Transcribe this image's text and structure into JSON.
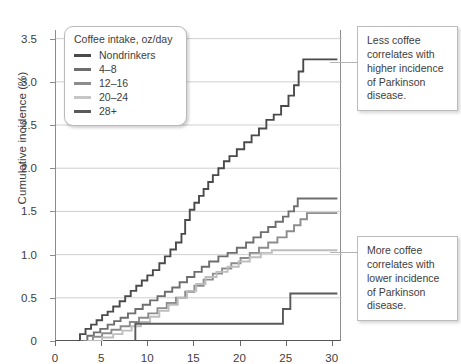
{
  "chart_data": {
    "type": "line",
    "title": "",
    "xlabel": "",
    "ylabel": "Cumulative incidence (%)",
    "xlim": [
      0,
      31
    ],
    "ylim": [
      0,
      3.6
    ],
    "xticks": [
      0,
      5,
      10,
      15,
      20,
      25,
      30
    ],
    "yticks": [
      "0",
      "0.5",
      "1.0",
      "1.5",
      "2.0",
      "2.5",
      "3.0",
      "3.5"
    ],
    "ytick_values": [
      0,
      0.5,
      1.0,
      1.5,
      2.0,
      2.5,
      3.0,
      3.5
    ],
    "grid": "horizontal",
    "step_style": "post",
    "legend_position": "top-left",
    "legend_title": "Coffee intake, oz/day",
    "series": [
      {
        "name": "Nondrinkers",
        "color": "#4a4a4a",
        "points": [
          [
            2.3,
            0.0
          ],
          [
            2.6,
            0.08
          ],
          [
            3.2,
            0.14
          ],
          [
            3.8,
            0.19
          ],
          [
            4.4,
            0.24
          ],
          [
            5.0,
            0.3
          ],
          [
            5.6,
            0.34
          ],
          [
            6.2,
            0.4
          ],
          [
            6.9,
            0.46
          ],
          [
            7.5,
            0.52
          ],
          [
            8.1,
            0.58
          ],
          [
            8.7,
            0.64
          ],
          [
            9.3,
            0.7
          ],
          [
            9.9,
            0.76
          ],
          [
            10.5,
            0.82
          ],
          [
            11.2,
            0.9
          ],
          [
            11.8,
            0.98
          ],
          [
            12.4,
            1.06
          ],
          [
            13.0,
            1.14
          ],
          [
            13.6,
            1.24
          ],
          [
            14.0,
            1.4
          ],
          [
            14.5,
            1.52
          ],
          [
            15.0,
            1.6
          ],
          [
            15.5,
            1.68
          ],
          [
            16.0,
            1.76
          ],
          [
            16.5,
            1.84
          ],
          [
            17.0,
            1.92
          ],
          [
            17.6,
            2.0
          ],
          [
            18.2,
            2.08
          ],
          [
            18.8,
            2.14
          ],
          [
            19.6,
            2.22
          ],
          [
            20.4,
            2.3
          ],
          [
            21.2,
            2.38
          ],
          [
            22.0,
            2.46
          ],
          [
            22.8,
            2.56
          ],
          [
            23.6,
            2.62
          ],
          [
            24.4,
            2.72
          ],
          [
            25.2,
            2.84
          ],
          [
            25.8,
            2.96
          ],
          [
            26.3,
            3.12
          ],
          [
            26.8,
            3.26
          ],
          [
            30.5,
            3.26
          ]
        ]
      },
      {
        "name": "4–8",
        "color": "#6e6e6e",
        "points": [
          [
            2.6,
            0.0
          ],
          [
            3.4,
            0.06
          ],
          [
            4.1,
            0.1
          ],
          [
            4.8,
            0.14
          ],
          [
            5.6,
            0.19
          ],
          [
            6.3,
            0.23
          ],
          [
            7.0,
            0.27
          ],
          [
            7.8,
            0.32
          ],
          [
            8.6,
            0.37
          ],
          [
            9.4,
            0.42
          ],
          [
            10.2,
            0.47
          ],
          [
            11.0,
            0.52
          ],
          [
            11.8,
            0.57
          ],
          [
            12.6,
            0.62
          ],
          [
            13.4,
            0.68
          ],
          [
            14.2,
            0.74
          ],
          [
            15.0,
            0.8
          ],
          [
            15.8,
            0.86
          ],
          [
            16.6,
            0.92
          ],
          [
            17.6,
            0.98
          ],
          [
            18.6,
            1.02
          ],
          [
            19.6,
            1.08
          ],
          [
            20.6,
            1.14
          ],
          [
            21.4,
            1.2
          ],
          [
            22.2,
            1.26
          ],
          [
            23.0,
            1.32
          ],
          [
            23.8,
            1.38
          ],
          [
            24.6,
            1.44
          ],
          [
            25.2,
            1.5
          ],
          [
            25.8,
            1.56
          ],
          [
            26.2,
            1.65
          ],
          [
            30.5,
            1.65
          ]
        ]
      },
      {
        "name": "12–16",
        "color": "#8c8c8c",
        "points": [
          [
            3.0,
            0.0
          ],
          [
            4.0,
            0.05
          ],
          [
            5.0,
            0.09
          ],
          [
            6.0,
            0.13
          ],
          [
            7.0,
            0.17
          ],
          [
            8.0,
            0.22
          ],
          [
            9.0,
            0.27
          ],
          [
            10.0,
            0.32
          ],
          [
            11.0,
            0.38
          ],
          [
            12.0,
            0.44
          ],
          [
            13.0,
            0.5
          ],
          [
            14.0,
            0.57
          ],
          [
            15.0,
            0.64
          ],
          [
            16.0,
            0.71
          ],
          [
            17.0,
            0.78
          ],
          [
            18.0,
            0.84
          ],
          [
            19.0,
            0.9
          ],
          [
            20.0,
            0.96
          ],
          [
            21.0,
            1.02
          ],
          [
            22.0,
            1.08
          ],
          [
            23.0,
            1.14
          ],
          [
            24.0,
            1.2
          ],
          [
            25.0,
            1.27
          ],
          [
            25.8,
            1.34
          ],
          [
            26.5,
            1.41
          ],
          [
            27.2,
            1.48
          ],
          [
            30.5,
            1.48
          ]
        ]
      },
      {
        "name": "20–24",
        "color": "#bdbdbd",
        "points": [
          [
            3.4,
            0.0
          ],
          [
            5.0,
            0.04
          ],
          [
            6.2,
            0.08
          ],
          [
            7.2,
            0.12
          ],
          [
            8.2,
            0.17
          ],
          [
            9.2,
            0.22
          ],
          [
            10.2,
            0.28
          ],
          [
            11.2,
            0.35
          ],
          [
            12.2,
            0.42
          ],
          [
            13.2,
            0.5
          ],
          [
            14.2,
            0.58
          ],
          [
            15.2,
            0.66
          ],
          [
            16.2,
            0.74
          ],
          [
            17.4,
            0.8
          ],
          [
            18.6,
            0.86
          ],
          [
            19.8,
            0.92
          ],
          [
            21.0,
            0.97
          ],
          [
            22.2,
            1.02
          ],
          [
            23.4,
            1.05
          ],
          [
            30.5,
            1.05
          ]
        ]
      },
      {
        "name": "28+",
        "color": "#5a5a5a",
        "points": [
          [
            8.4,
            0.0
          ],
          [
            8.6,
            0.2
          ],
          [
            23.8,
            0.2
          ],
          [
            24.6,
            0.37
          ],
          [
            25.4,
            0.55
          ],
          [
            30.5,
            0.55
          ]
        ]
      }
    ]
  },
  "legend": {
    "title": "Coffee intake, oz/day",
    "items": [
      {
        "label": "Nondrinkers",
        "color": "#4a4a4a"
      },
      {
        "label": "4–8",
        "color": "#6e6e6e"
      },
      {
        "label": "12–16",
        "color": "#8c8c8c"
      },
      {
        "label": "20–24",
        "color": "#c6c6c6"
      },
      {
        "label": "28+",
        "color": "#5a5a5a"
      }
    ]
  },
  "callouts": {
    "top": "Less coffee correlates with higher incidence of Parkinson disease.",
    "bottom": "More coffee correlates with lower incidence of Parkinson disease."
  }
}
